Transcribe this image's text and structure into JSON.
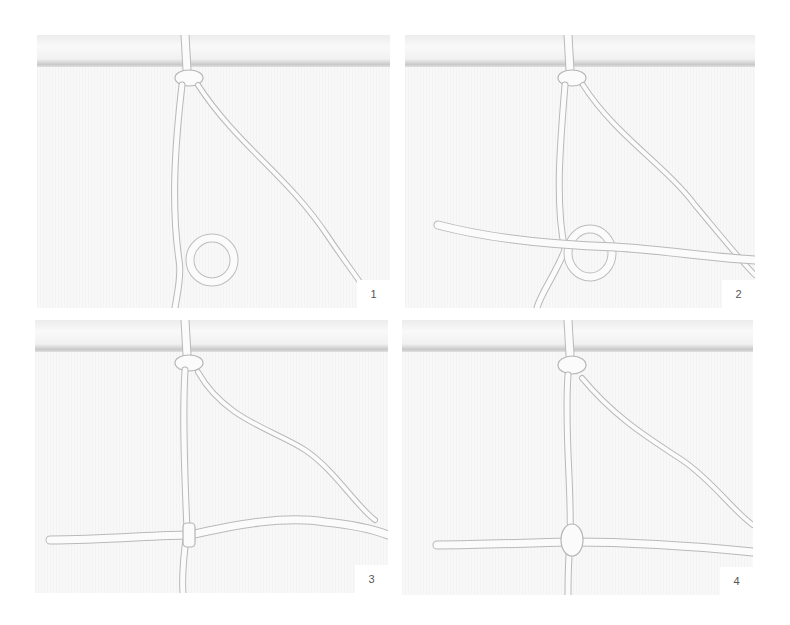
{
  "panels": [
    {
      "step": "1",
      "description": "Working cord forms a loop over the vertical anchor cord"
    },
    {
      "step": "2",
      "description": "Horizontal cord passed through the loop"
    },
    {
      "step": "3",
      "description": "Loop tightened around the horizontal cord"
    },
    {
      "step": "4",
      "description": "Finished knot secured on the horizontal cord"
    }
  ],
  "colors": {
    "background": "#ffffff",
    "photo_background": "#f6f6f6",
    "cord": "#fbfbfb",
    "cord_shadow": "#b9b9b9",
    "label_text": "#555555"
  }
}
